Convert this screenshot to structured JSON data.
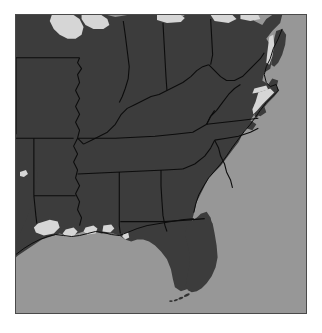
{
  "map": {
    "title": "Southeastern United States Reference Map",
    "region": "Southeastern United States",
    "projection_note": "raster grayscale basemap",
    "colors": {
      "land": "#3a3a3a",
      "ocean": "#969696",
      "inland_water": "#d6d6d6",
      "boundary_line": "#0a0a0a",
      "coastline": "#0a0a0a",
      "frame": "#4a4a4a",
      "page_background": "#ffffff"
    },
    "legend_items": [
      {
        "name": "land",
        "label": "Land",
        "color": "#3a3a3a"
      },
      {
        "name": "ocean",
        "label": "Ocean / Gulf",
        "color": "#969696"
      },
      {
        "name": "inland-water",
        "label": "Lakes and Bays",
        "color": "#d6d6d6"
      },
      {
        "name": "state-boundary",
        "label": "State Boundary",
        "color": "#0a0a0a"
      }
    ],
    "water_bodies": [
      "Lake Michigan",
      "Lake Erie",
      "Lake Huron",
      "Chesapeake Bay",
      "Pamlico Sound",
      "Albemarle Sound",
      "Lake Pontchartrain",
      "Gulf of Mexico",
      "Atlantic Ocean"
    ],
    "states_visible": [
      "Iowa",
      "Illinois",
      "Indiana",
      "Ohio",
      "Missouri",
      "Kentucky",
      "West Virginia",
      "Virginia",
      "Maryland",
      "Delaware",
      "New Jersey",
      "Pennsylvania",
      "Tennessee",
      "North Carolina",
      "South Carolina",
      "Arkansas",
      "Mississippi",
      "Alabama",
      "Georgia",
      "Louisiana",
      "Texas",
      "Oklahoma",
      "Florida"
    ]
  }
}
